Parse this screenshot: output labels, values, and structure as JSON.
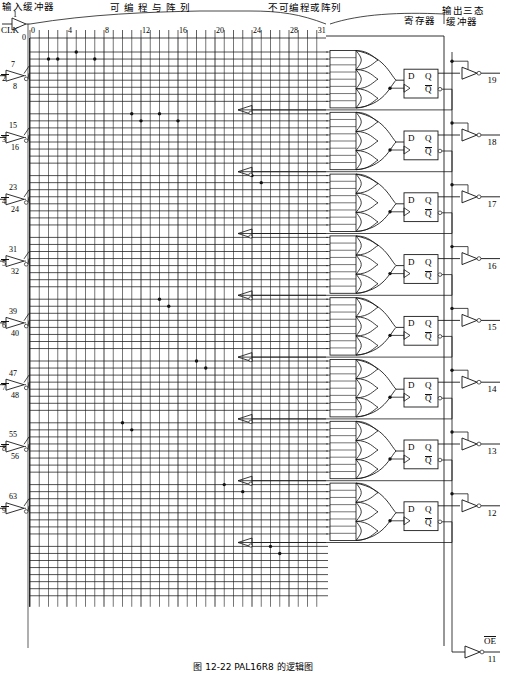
{
  "figure": {
    "caption": "图 12-22  PAL16R8 的逻辑图",
    "title_and_array": "可 编 程 与 阵 列",
    "fixed_or_array": "不可编程或阵列",
    "input_buffer_label": "输入缓冲器",
    "register_label": "寄存器",
    "output_buffer_label": "输出三态\n缓冲器",
    "output_buffer_line1": "输出三态",
    "output_buffer_line2": "缓冲器"
  },
  "clock": {
    "name": "CLK",
    "pin": "1",
    "row_label": "0"
  },
  "column_axis": {
    "ticks": [
      "0",
      "4",
      "8",
      "12",
      "16",
      "20",
      "24",
      "28",
      "31"
    ],
    "count": 32
  },
  "inputs": [
    {
      "pin": "2",
      "true_line": "7",
      "comp_line": "8"
    },
    {
      "pin": "3",
      "true_line": "15",
      "comp_line": "16"
    },
    {
      "pin": "4",
      "true_line": "23",
      "comp_line": "24"
    },
    {
      "pin": "5",
      "true_line": "31",
      "comp_line": "32"
    },
    {
      "pin": "6",
      "true_line": "39",
      "comp_line": "40"
    },
    {
      "pin": "7",
      "true_line": "47",
      "comp_line": "48"
    },
    {
      "pin": "8",
      "true_line": "55",
      "comp_line": "56"
    },
    {
      "pin": "9",
      "true_line": "63",
      "comp_line": ""
    }
  ],
  "outputs": [
    {
      "pin": "19",
      "d": "D",
      "q": "Q",
      "qbar": "Q"
    },
    {
      "pin": "18",
      "d": "D",
      "q": "Q",
      "qbar": "Q"
    },
    {
      "pin": "17",
      "d": "D",
      "q": "Q",
      "qbar": "Q"
    },
    {
      "pin": "16",
      "d": "D",
      "q": "Q",
      "qbar": "Q"
    },
    {
      "pin": "15",
      "d": "D",
      "q": "Q",
      "qbar": "Q"
    },
    {
      "pin": "14",
      "d": "D",
      "q": "Q",
      "qbar": "Q"
    },
    {
      "pin": "13",
      "d": "D",
      "q": "Q",
      "qbar": "Q"
    },
    {
      "pin": "12",
      "d": "D",
      "q": "Q",
      "qbar": "Q"
    }
  ],
  "output_enable": {
    "label": "OE",
    "pin": "11"
  },
  "fuse_dots": [
    {
      "col": 2,
      "row_group": 0,
      "row": 1
    },
    {
      "col": 5,
      "row_group": 0,
      "row": 0
    },
    {
      "col": 3,
      "row_group": 0,
      "row": 1
    },
    {
      "col": 7,
      "row_group": 0,
      "row": 1
    },
    {
      "col": 11,
      "row_group": 1,
      "row": 0
    },
    {
      "col": 14,
      "row_group": 1,
      "row": 0
    },
    {
      "col": 12,
      "row_group": 1,
      "row": 1
    },
    {
      "col": 16,
      "row_group": 1,
      "row": 1
    },
    {
      "col": 24,
      "row_group": 2,
      "row": 0
    },
    {
      "col": 25,
      "row_group": 2,
      "row": 1
    },
    {
      "col": 14,
      "row_group": 4,
      "row": 0
    },
    {
      "col": 15,
      "row_group": 4,
      "row": 1
    },
    {
      "col": 18,
      "row_group": 5,
      "row": 0
    },
    {
      "col": 19,
      "row_group": 5,
      "row": 1
    },
    {
      "col": 10,
      "row_group": 6,
      "row": 0
    },
    {
      "col": 11,
      "row_group": 6,
      "row": 1
    },
    {
      "col": 21,
      "row_group": 7,
      "row": 0
    },
    {
      "col": 23,
      "row_group": 7,
      "row": 1
    },
    {
      "col": 26,
      "row_group": 8,
      "row": 0
    },
    {
      "col": 27,
      "row_group": 8,
      "row": 1
    }
  ]
}
